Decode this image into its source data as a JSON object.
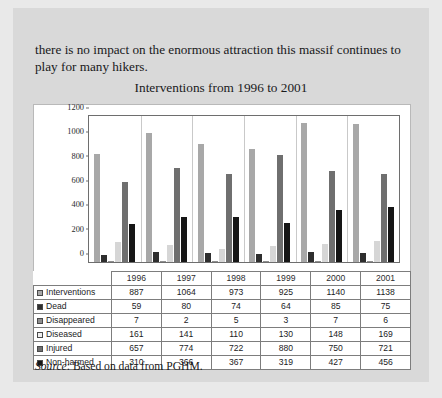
{
  "document": {
    "paragraph": "there is no impact on the enormous attraction this massif continues to play for many hikers.",
    "source_label": "Source",
    "source_text": ": Based on data from PGHM."
  },
  "chart_data": {
    "type": "bar",
    "title": "Interventions from 1996 to 2001",
    "xlabel": "",
    "ylabel": "",
    "ylim": [
      0,
      1200
    ],
    "yticks": [
      "0",
      "200",
      "400",
      "600",
      "800",
      "1000",
      "1200"
    ],
    "grid": false,
    "legend_position": "table",
    "categories": [
      "1996",
      "1997",
      "1998",
      "1999",
      "2000",
      "2001"
    ],
    "series": [
      {
        "name": "Interventions",
        "values": [
          887,
          1064,
          973,
          925,
          1140,
          1138
        ],
        "color": "#a8a8a8"
      },
      {
        "name": "Dead",
        "values": [
          59,
          80,
          74,
          64,
          85,
          75
        ],
        "color": "#2e2e2e"
      },
      {
        "name": "Disappeared",
        "values": [
          7,
          2,
          5,
          3,
          7,
          6
        ],
        "color": "#8f8f8f"
      },
      {
        "name": "Diseased",
        "values": [
          161,
          141,
          110,
          130,
          148,
          169
        ],
        "color": "#d6d6d6"
      },
      {
        "name": "Injured",
        "values": [
          657,
          774,
          722,
          880,
          750,
          721
        ],
        "color": "#6f6f6f"
      },
      {
        "name": "Non-harmed",
        "values": [
          310,
          366,
          367,
          319,
          427,
          456
        ],
        "color": "#161616"
      }
    ]
  },
  "table": {
    "column_headers": [
      "",
      "1996",
      "1997",
      "1998",
      "1999",
      "2000",
      "2001"
    ],
    "rows": [
      {
        "label": "Interventions",
        "values": [
          "887",
          "1064",
          "973",
          "925",
          "1140",
          "1138"
        ],
        "swatch": "#a8a8a8"
      },
      {
        "label": "Dead",
        "values": [
          "59",
          "80",
          "74",
          "64",
          "85",
          "75"
        ],
        "swatch": "#2e2e2e"
      },
      {
        "label": "Disappeared",
        "values": [
          "7",
          "2",
          "5",
          "3",
          "7",
          "6"
        ],
        "swatch": "#8f8f8f"
      },
      {
        "label": "Diseased",
        "values": [
          "161",
          "141",
          "110",
          "130",
          "148",
          "169"
        ],
        "swatch": "#efefef"
      },
      {
        "label": "Injured",
        "values": [
          "657",
          "774",
          "722",
          "880",
          "750",
          "721"
        ],
        "swatch": "#6f6f6f"
      },
      {
        "label": "Non-harmed",
        "values": [
          "310",
          "366",
          "367",
          "319",
          "427",
          "456"
        ],
        "swatch": "#161616"
      }
    ]
  }
}
